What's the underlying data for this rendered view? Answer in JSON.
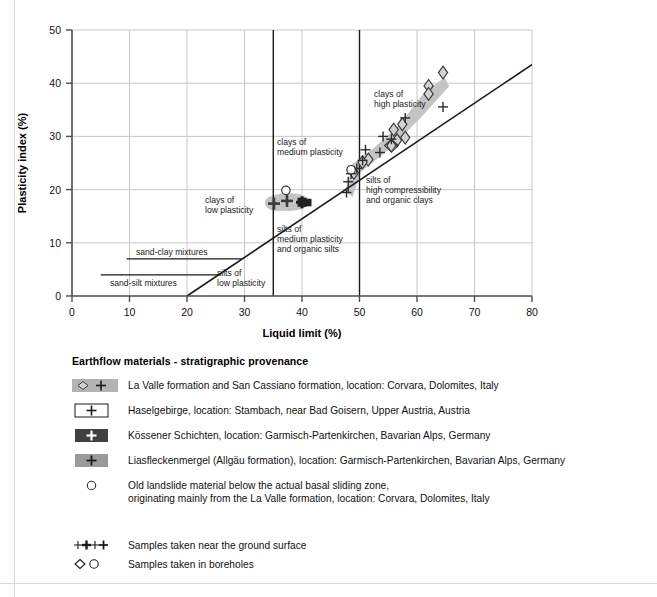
{
  "chart_data": {
    "type": "scatter",
    "title": "",
    "xlabel": "Liquid limit (%)",
    "ylabel": "Plasticity index (%)",
    "xlim": [
      0,
      80
    ],
    "ylim": [
      0,
      50
    ],
    "xticks": [
      0,
      10,
      20,
      30,
      40,
      50,
      60,
      70,
      80
    ],
    "yticks": [
      0,
      10,
      20,
      30,
      40,
      50
    ],
    "grid": true,
    "legend_position": "below-plot",
    "reference_lines": [
      {
        "name": "a-line",
        "label": "",
        "x": [
          20,
          80
        ],
        "y": [
          0,
          43.5
        ],
        "style": "solid-dark"
      },
      {
        "name": "ll-35-divider",
        "x": [
          35,
          35
        ],
        "y": [
          0,
          50
        ],
        "style": "solid-dark"
      },
      {
        "name": "ll-50-divider",
        "x": [
          50,
          50
        ],
        "y": [
          0,
          50
        ],
        "style": "solid-dark"
      }
    ],
    "annotation_lines": [
      {
        "name": "sand-clay-mixtures-line",
        "x": [
          9.5,
          29.5
        ],
        "y": [
          7,
          7
        ]
      },
      {
        "name": "sand-silt-mixtures-line",
        "x": [
          5.0,
          25.5
        ],
        "y": [
          4,
          4
        ]
      }
    ],
    "region_labels": [
      {
        "text": "clays of\nhigh plasticity",
        "x": 52.5,
        "y": 34.5
      },
      {
        "text": "clays of\nmedium plasticity",
        "x": 36.0,
        "y": 28.0
      },
      {
        "text": "clays of\nlow plasticity",
        "x": 23.5,
        "y": 18.0
      },
      {
        "text": "silts of\nhigh compressibility\nand organic clays",
        "x": 51.0,
        "y": 21.0
      },
      {
        "text": "silts of\nmedium plasticity\nand organic silts",
        "x": 36.0,
        "y": 11.5
      },
      {
        "text": "silts of\nlow plasticity",
        "x": 28.5,
        "y": 4.0
      },
      {
        "text": "sand-clay mixtures",
        "x": 13.5,
        "y": 8.3
      },
      {
        "text": "sand-silt mixtures",
        "x": 10.5,
        "y": 2.8
      }
    ],
    "series": [
      {
        "name": "La Valle formation and San Cassiano formation",
        "marker_borehole": "diamond",
        "marker_surface": "plus",
        "fill": "#b3b3b3",
        "points_diamond": [
          [
            64.5,
            40.0
          ],
          [
            62.0,
            37.5
          ],
          [
            62.0,
            36.0
          ],
          [
            57.5,
            32.0
          ],
          [
            56.0,
            31.0
          ],
          [
            58.0,
            29.5
          ],
          [
            55.5,
            28.0
          ],
          [
            56.5,
            29.0
          ],
          [
            51.5,
            26.5
          ],
          [
            50.5,
            26.0
          ],
          [
            49.0,
            24.0
          ]
        ],
        "points_plus": [
          [
            64.5,
            35.5
          ],
          [
            58.0,
            32.0
          ],
          [
            54.0,
            28.5
          ],
          [
            55.5,
            28.0
          ],
          [
            53.5,
            26.0
          ],
          [
            51.0,
            26.5
          ],
          [
            50.5,
            24.5
          ],
          [
            49.5,
            23.0
          ],
          [
            48.5,
            22.0
          ],
          [
            48.0,
            20.5
          ]
        ]
      },
      {
        "name": "Haselgebirge",
        "marker_surface": "plus",
        "fill": "#ffffff",
        "points_plus": [
          [
            37.0,
            17.0
          ],
          [
            38.5,
            17.5
          ],
          [
            39.5,
            18.5
          ]
        ]
      },
      {
        "name": "Kössener Schichten",
        "marker_surface": "plus",
        "fill": "#404040",
        "points_plus": [
          [
            41.0,
            17.5
          ],
          [
            41.8,
            17.3
          ]
        ]
      },
      {
        "name": "Liasfleckenmergel (Allgäu formation)",
        "marker_surface": "plus",
        "fill": "#9a9a9a",
        "points_plus": [
          [
            37.5,
            17.0
          ],
          [
            38.5,
            17.8
          ],
          [
            39.2,
            17.2
          ]
        ]
      },
      {
        "name": "Old landslide material",
        "marker_borehole": "circle",
        "fill": "#ffffff",
        "points_circle": [
          [
            37.2,
            19.3
          ],
          [
            48.5,
            23.8
          ]
        ]
      }
    ],
    "shaded_band": {
      "name": "la-valle-envelope",
      "color": "#c4c4c4",
      "polygon": [
        [
          47.6,
          19.6
        ],
        [
          48.8,
          24.8
        ],
        [
          52.2,
          27.5
        ],
        [
          56.8,
          32.0
        ],
        [
          61.5,
          38.5
        ],
        [
          64.8,
          41.0
        ],
        [
          65.6,
          39.4
        ],
        [
          60.6,
          33.4
        ],
        [
          55.2,
          27.6
        ],
        [
          50.2,
          23.2
        ],
        [
          48.8,
          18.6
        ]
      ]
    },
    "cluster_shade": {
      "name": "low-plasticity-cluster-shade",
      "color": "#c4c4c4"
    }
  },
  "legend": {
    "title": "Earthflow materials - stratigraphic provenance",
    "entries": [
      {
        "swatch": "gray-diamond-plus",
        "text": "La Valle formation and San Cassiano formation, location: Corvara, Dolomites, Italy"
      },
      {
        "swatch": "white-box-plus",
        "text": "Haselgebirge, location: Stambach, near Bad Goisern, Upper Austria, Austria"
      },
      {
        "swatch": "dark-box-plus",
        "text": "Kössener Schichten, location: Garmisch-Partenkirchen, Bavarian Alps, Germany"
      },
      {
        "swatch": "gray-box-plus",
        "text": "Liasfleckenmergel (Allgäu formation), location: Garmisch-Partenkirchen, Bavarian Alps, Germany"
      },
      {
        "swatch": "circle-only",
        "text": "Old landslide material below the actual basal sliding zone,\noriginating mainly from the La Valle formation, location: Corvara, Dolomites, Italy"
      }
    ],
    "symbol_entries": [
      {
        "swatch": "plus-group",
        "text": "Samples taken near the ground surface"
      },
      {
        "swatch": "diamond-circle",
        "text": "Samples taken in boreholes"
      }
    ]
  },
  "colors": {
    "grid": "#c8c8c8",
    "axis": "#4d4d4d",
    "band": "#c4c4c4",
    "dark_swatch": "#404040",
    "mid_swatch": "#9a9a9a",
    "light_swatch": "#b3b3b3"
  }
}
